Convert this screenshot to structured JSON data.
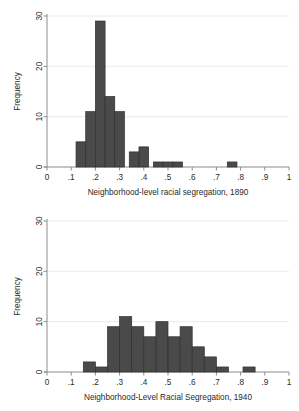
{
  "figure": {
    "background_color": "#ffffff",
    "bar_fill": "#4a4a4a",
    "bar_stroke": "#2f2f2f",
    "grid_color": "#e8e8e8",
    "axis_color": "#8c8c8c",
    "text_color": "#2a2a2a"
  },
  "chart_data": [
    {
      "type": "bar",
      "id": "histogram-1890",
      "title": "",
      "xlabel": "Neighborhood-level racial segregation, 1890",
      "ylabel": "Frequency",
      "xlim": [
        0,
        1
      ],
      "ylim": [
        0,
        30
      ],
      "xticks": [
        0,
        0.1,
        0.2,
        0.3,
        0.4,
        0.5,
        0.6,
        0.7,
        0.8,
        0.9,
        1
      ],
      "xticklabels": [
        "0",
        ".1",
        ".2",
        ".3",
        ".4",
        ".5",
        ".6",
        ".7",
        ".8",
        ".9",
        "1"
      ],
      "yticks": [
        0,
        10,
        20,
        30
      ],
      "yticklabels": [
        "0",
        "10",
        "20",
        "30"
      ],
      "grid": true,
      "grid_axis": "y",
      "bin_width": 0.04,
      "bins": [
        {
          "x0": 0.12,
          "x1": 0.16,
          "value": 5
        },
        {
          "x0": 0.16,
          "x1": 0.2,
          "value": 11
        },
        {
          "x0": 0.2,
          "x1": 0.24,
          "value": 29
        },
        {
          "x0": 0.24,
          "x1": 0.28,
          "value": 14
        },
        {
          "x0": 0.28,
          "x1": 0.32,
          "value": 11
        },
        {
          "x0": 0.34,
          "x1": 0.38,
          "value": 3
        },
        {
          "x0": 0.38,
          "x1": 0.42,
          "value": 4
        },
        {
          "x0": 0.44,
          "x1": 0.48,
          "value": 1
        },
        {
          "x0": 0.48,
          "x1": 0.52,
          "value": 1
        },
        {
          "x0": 0.52,
          "x1": 0.56,
          "value": 1
        },
        {
          "x0": 0.745,
          "x1": 0.785,
          "value": 1
        }
      ]
    },
    {
      "type": "bar",
      "id": "histogram-1940",
      "title": "",
      "xlabel": "Neighborhood-Level Racial Segregation, 1940",
      "ylabel": "Frequency",
      "xlim": [
        0,
        1
      ],
      "ylim": [
        0,
        30
      ],
      "xticks": [
        0,
        0.1,
        0.2,
        0.3,
        0.4,
        0.5,
        0.6,
        0.7,
        0.8,
        0.9,
        1
      ],
      "xticklabels": [
        "0",
        ".1",
        ".2",
        ".3",
        ".4",
        ".5",
        ".6",
        ".7",
        ".8",
        ".9",
        "1"
      ],
      "yticks": [
        0,
        10,
        20,
        30
      ],
      "yticklabels": [
        "0",
        "10",
        "20",
        "30"
      ],
      "grid": true,
      "grid_axis": "y",
      "bin_width": 0.05,
      "bins": [
        {
          "x0": 0.15,
          "x1": 0.2,
          "value": 2
        },
        {
          "x0": 0.2,
          "x1": 0.25,
          "value": 1
        },
        {
          "x0": 0.25,
          "x1": 0.3,
          "value": 9
        },
        {
          "x0": 0.3,
          "x1": 0.35,
          "value": 11
        },
        {
          "x0": 0.35,
          "x1": 0.4,
          "value": 9
        },
        {
          "x0": 0.4,
          "x1": 0.45,
          "value": 7
        },
        {
          "x0": 0.45,
          "x1": 0.5,
          "value": 10
        },
        {
          "x0": 0.5,
          "x1": 0.55,
          "value": 7
        },
        {
          "x0": 0.55,
          "x1": 0.6,
          "value": 9
        },
        {
          "x0": 0.6,
          "x1": 0.65,
          "value": 5
        },
        {
          "x0": 0.65,
          "x1": 0.7,
          "value": 3
        },
        {
          "x0": 0.7,
          "x1": 0.75,
          "value": 1
        },
        {
          "x0": 0.81,
          "x1": 0.86,
          "value": 1
        }
      ]
    }
  ]
}
